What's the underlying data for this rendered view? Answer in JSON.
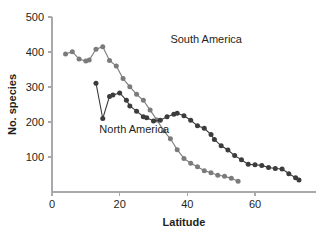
{
  "chart_data": {
    "type": "line",
    "title": "",
    "xlabel": "Latitude",
    "ylabel": "No. species",
    "xlim": [
      0,
      78
    ],
    "ylim": [
      0,
      500
    ],
    "xticks": [
      0,
      20,
      40,
      60
    ],
    "yticks": [
      100,
      200,
      300,
      400,
      500
    ],
    "grid": false,
    "legend_position": "inline-annotations",
    "series": [
      {
        "name": "South America",
        "color": "#7b7b7b",
        "marker": "circle",
        "label_x": 35,
        "label_y": 425,
        "points": [
          [
            4,
            394
          ],
          [
            6,
            401
          ],
          [
            8,
            380
          ],
          [
            10,
            374
          ],
          [
            11,
            377
          ],
          [
            13,
            408
          ],
          [
            15,
            415
          ],
          [
            17,
            376
          ],
          [
            19,
            360
          ],
          [
            21,
            324
          ],
          [
            23,
            301
          ],
          [
            25,
            279
          ],
          [
            27,
            262
          ],
          [
            29,
            234
          ],
          [
            31,
            206
          ],
          [
            33,
            175
          ],
          [
            35,
            152
          ],
          [
            37,
            121
          ],
          [
            39,
            96
          ],
          [
            41,
            82
          ],
          [
            43,
            72
          ],
          [
            45,
            61
          ],
          [
            47,
            55
          ],
          [
            49,
            48
          ],
          [
            51,
            45
          ],
          [
            53,
            39
          ],
          [
            55,
            31
          ]
        ]
      },
      {
        "name": "North America",
        "color": "#3c3c3c",
        "marker": "circle",
        "label_x": 14,
        "label_y": 170,
        "points": [
          [
            13,
            311
          ],
          [
            15,
            210
          ],
          [
            17,
            273
          ],
          [
            18,
            277
          ],
          [
            20,
            283
          ],
          [
            22,
            262
          ],
          [
            23,
            246
          ],
          [
            25,
            231
          ],
          [
            27,
            215
          ],
          [
            28,
            212
          ],
          [
            30,
            203
          ],
          [
            32,
            205
          ],
          [
            34,
            215
          ],
          [
            36,
            222
          ],
          [
            37,
            225
          ],
          [
            39,
            218
          ],
          [
            41,
            205
          ],
          [
            43,
            189
          ],
          [
            45,
            182
          ],
          [
            47,
            164
          ],
          [
            48,
            150
          ],
          [
            50,
            132
          ],
          [
            52,
            120
          ],
          [
            54,
            104
          ],
          [
            56,
            92
          ],
          [
            58,
            79
          ],
          [
            60,
            78
          ],
          [
            62,
            76
          ],
          [
            64,
            70
          ],
          [
            66,
            67
          ],
          [
            68,
            66
          ],
          [
            70,
            52
          ],
          [
            72,
            41
          ],
          [
            73,
            34
          ]
        ]
      }
    ]
  }
}
